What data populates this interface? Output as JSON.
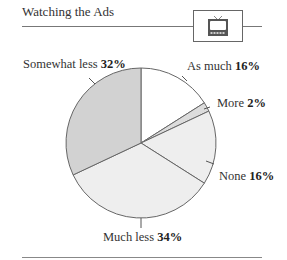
{
  "header": {
    "title": "Watching the Ads",
    "icon": "tv-icon"
  },
  "colors": {
    "as_much": "#ffffff",
    "more": "#dcdcdc",
    "none": "#eeeeee",
    "much_less": "#eeeeee",
    "somewhat_less": "#d2d2d2",
    "stroke": "#666666"
  },
  "labels": {
    "as_much": {
      "name": "As much",
      "value": "16%"
    },
    "more": {
      "name": "More",
      "value": "2%"
    },
    "none": {
      "name": "None",
      "value": "16%"
    },
    "much_less": {
      "name": "Much less",
      "value": "34%"
    },
    "somewhat_less": {
      "name": "Somewhat less",
      "value": "32%"
    }
  },
  "chart_data": {
    "type": "pie",
    "title": "Watching the Ads",
    "categories": [
      "As much",
      "More",
      "None",
      "Much less",
      "Somewhat less"
    ],
    "values": [
      16,
      2,
      16,
      34,
      32
    ],
    "unit": "%",
    "start_angle": "12 o'clock, clockwise",
    "legend": "none (direct labels)"
  }
}
